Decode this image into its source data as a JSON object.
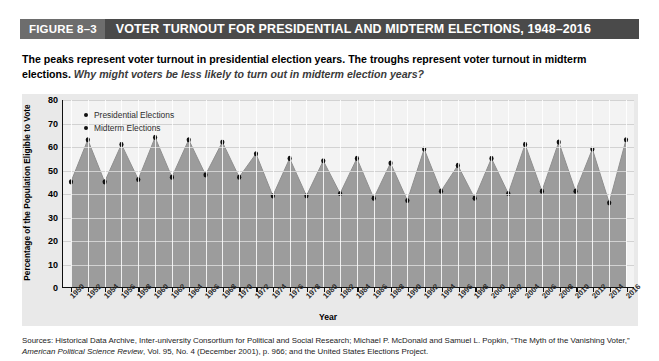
{
  "header": {
    "figure_tag": "FIGURE 8–3",
    "title": "VOTER TURNOUT FOR PRESIDENTIAL AND MIDTERM ELECTIONS, 1948–2016",
    "tag_bg": "#6d6d6d",
    "bar_bg": "#4a4a4a",
    "text_color": "#ffffff"
  },
  "subtitle": {
    "statement": "The peaks represent voter turnout in presidential election years. The troughs represent voter turnout in midterm elections.",
    "question": "Why might voters be less likely to turn out in midterm election years?"
  },
  "legend": [
    {
      "label": "Presidential Elections",
      "marker": "dot",
      "color": "#111111"
    },
    {
      "label": "Midterm Elections",
      "marker": "dot",
      "color": "#111111"
    }
  ],
  "axis": {
    "y_title": "Percentage of the Population Eligible to Vote",
    "x_title": "Year",
    "y_ticks": [
      "80",
      "70",
      "60",
      "50",
      "40",
      "30",
      "20",
      "10",
      "0"
    ]
  },
  "source": {
    "prefix": "Sources: Historical Data Archive, Inter-university Consortium for Political and Social Research; Michael P. McDonald and Samuel L. Popkin, “The Myth of the Vanishing Voter,” ",
    "italic": "American Political Science Review",
    "suffix": ", Vol. 95, No. 4 (December 2001), p. 966; and the United States Elections Project."
  },
  "colors": {
    "page_bg": "#ffffff",
    "chart_bg": "#e9e9e9",
    "plot_bg": "#f3f3f3",
    "area_fill": "#9c9c9c",
    "grid": "#d2d2d2",
    "axis": "#111111"
  },
  "chart_data": {
    "type": "area",
    "title": "VOTER TURNOUT FOR PRESIDENTIAL AND MIDTERM ELECTIONS, 1948–2016",
    "xlabel": "Year",
    "ylabel": "Percentage of the Population Eligible to Vote",
    "ylim": [
      0,
      80
    ],
    "ytick_step": 10,
    "grid": true,
    "legend_position": "top-left",
    "x_tick_labels": [
      "1950",
      "1952",
      "1954",
      "1956",
      "1958",
      "1960",
      "1962",
      "1964",
      "1966",
      "1968",
      "1970",
      "1972",
      "1974",
      "1976",
      "1978",
      "1980",
      "1982",
      "1984",
      "1986",
      "1988",
      "1990",
      "1992",
      "1994",
      "1996",
      "1998",
      "2000",
      "2002",
      "2004",
      "2006",
      "2008",
      "2010",
      "2012",
      "2014",
      "2016"
    ],
    "x": [
      1950,
      1952,
      1954,
      1956,
      1958,
      1960,
      1962,
      1964,
      1966,
      1968,
      1970,
      1972,
      1974,
      1976,
      1978,
      1980,
      1982,
      1984,
      1986,
      1988,
      1990,
      1992,
      1994,
      1996,
      1998,
      2000,
      2002,
      2004,
      2006,
      2008,
      2010,
      2012,
      2014,
      2016
    ],
    "values": [
      45,
      63,
      45,
      61,
      46,
      64,
      47,
      63,
      48,
      62,
      47,
      57,
      39,
      55,
      39,
      54,
      40,
      55,
      38,
      53,
      37,
      59,
      41,
      52,
      38,
      55,
      40,
      61,
      41,
      62,
      41,
      59,
      36,
      63
    ],
    "series": [
      {
        "name": "Presidential Elections",
        "x": [
          1952,
          1956,
          1960,
          1964,
          1968,
          1972,
          1976,
          1980,
          1984,
          1988,
          1992,
          1996,
          2000,
          2004,
          2008,
          2012,
          2016
        ],
        "values": [
          63,
          61,
          64,
          63,
          62,
          57,
          55,
          54,
          55,
          53,
          59,
          52,
          55,
          61,
          62,
          59,
          63
        ]
      },
      {
        "name": "Midterm Elections",
        "x": [
          1950,
          1954,
          1958,
          1962,
          1966,
          1970,
          1974,
          1978,
          1982,
          1986,
          1990,
          1994,
          1998,
          2002,
          2006,
          2010,
          2014
        ],
        "values": [
          45,
          45,
          46,
          47,
          48,
          47,
          39,
          39,
          40,
          38,
          37,
          41,
          38,
          40,
          41,
          41,
          36
        ]
      }
    ]
  }
}
